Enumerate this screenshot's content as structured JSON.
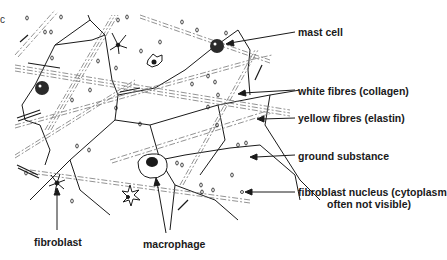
{
  "diagram": {
    "type": "labelled biological illustration",
    "edge_fragment": "c",
    "colors": {
      "ink": "#1a1a1a",
      "background": "#ffffff",
      "fibre_grey": "#777777"
    },
    "labels": {
      "mast_cell": "mast cell",
      "white_fibres": "white fibres (collagen)",
      "yellow_fibres": "yellow fibres (elastin)",
      "ground_substance": "ground substance",
      "fibroblast_nucleus_line1": "fibroblast nucleus (cytoplasm",
      "fibroblast_nucleus_line2": "often not visible)",
      "fibroblast": "fibroblast",
      "macrophage": "macrophage"
    }
  }
}
